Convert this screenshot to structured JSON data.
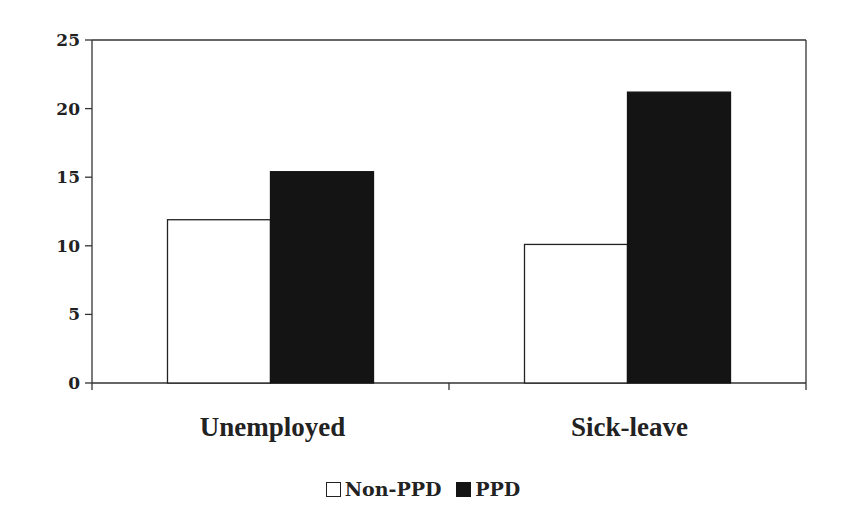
{
  "chart_data": {
    "type": "bar",
    "title": "",
    "xlabel": "",
    "ylabel": "",
    "categories": [
      "Unemployed",
      "Sick-leave"
    ],
    "series": [
      {
        "name": "Non-PPD",
        "values": [
          11.9,
          10.1
        ],
        "fill": "#ffffff",
        "stroke": "#222222"
      },
      {
        "name": "PPD",
        "values": [
          15.4,
          21.2
        ],
        "fill": "#141414",
        "stroke": "#141414"
      }
    ],
    "ylim": [
      0,
      25
    ],
    "yticks": [
      0,
      5,
      10,
      15,
      20,
      25
    ],
    "grid": false,
    "legend_position": "bottom"
  },
  "legend": {
    "items": [
      {
        "label": "Non-PPD",
        "fill": "#ffffff",
        "border": "#222222"
      },
      {
        "label": "PPD",
        "fill": "#141414",
        "border": "#141414"
      }
    ]
  }
}
